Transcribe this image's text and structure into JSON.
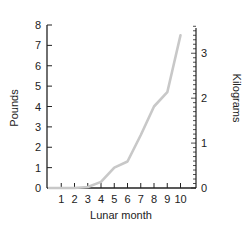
{
  "chart_data": {
    "type": "line",
    "title": "",
    "xlabel": "Lunar month",
    "ylabel": "Pounds",
    "y2label": "Kilograms",
    "x": [
      1,
      2,
      3,
      4,
      5,
      6,
      7,
      8,
      9,
      10
    ],
    "x_tick_labels": [
      "1",
      "2",
      "3",
      "4",
      "5",
      "6",
      "7",
      "8",
      "9",
      "10"
    ],
    "y_tick_labels": [
      "0",
      "1",
      "2",
      "3",
      "4",
      "5",
      "6",
      "7",
      "8"
    ],
    "y2_tick_labels": [
      "0",
      "1",
      "2",
      "3"
    ],
    "ylim": [
      0,
      8
    ],
    "y2lim": [
      0,
      3.63
    ],
    "grid": false,
    "legend": null,
    "series": [
      {
        "name": "Fetal weight",
        "color": "#c8c8c8",
        "points": [
          [
            1,
            0
          ],
          [
            2,
            0
          ],
          [
            3,
            0.05
          ],
          [
            4,
            0.3
          ],
          [
            5,
            1.0
          ],
          [
            6,
            1.3
          ],
          [
            7,
            2.6
          ],
          [
            8,
            4.0
          ],
          [
            9,
            4.7
          ],
          [
            10,
            7.5
          ]
        ]
      }
    ]
  }
}
